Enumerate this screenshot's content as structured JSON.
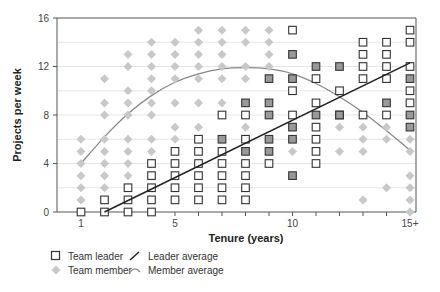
{
  "chart_data": {
    "type": "scatter",
    "title": "",
    "xlabel": "Tenure (years)",
    "ylabel": "Projects per week",
    "xlim": [
      0.5,
      15.25
    ],
    "ylim": [
      0,
      16
    ],
    "x_ticks": [
      1,
      2,
      3,
      4,
      5,
      6,
      7,
      8,
      9,
      10,
      11,
      12,
      13,
      14,
      15
    ],
    "x_tick_labels": {
      "1": "1",
      "5": "5",
      "10": "10",
      "15": "15+"
    },
    "y_ticks": [
      0,
      4,
      8,
      12,
      16
    ],
    "y_gridlines": [
      2,
      4,
      6,
      8,
      10,
      12,
      14
    ],
    "grid": true,
    "legend_position": "bottom-left",
    "series": [
      {
        "name": "Team member",
        "marker": "diamond",
        "color": "#c8c8c8",
        "points": [
          [
            1,
            1
          ],
          [
            1,
            2
          ],
          [
            1,
            3
          ],
          [
            1,
            4
          ],
          [
            1,
            5
          ],
          [
            1,
            6
          ],
          [
            2,
            2
          ],
          [
            2,
            3
          ],
          [
            2,
            4
          ],
          [
            2,
            5
          ],
          [
            2,
            6
          ],
          [
            2,
            8
          ],
          [
            2,
            9
          ],
          [
            2,
            11
          ],
          [
            3,
            3
          ],
          [
            3,
            4
          ],
          [
            3,
            5
          ],
          [
            3,
            6
          ],
          [
            3,
            8
          ],
          [
            3,
            9
          ],
          [
            3,
            10
          ],
          [
            3,
            12
          ],
          [
            3,
            13
          ],
          [
            4,
            5
          ],
          [
            4,
            6
          ],
          [
            4,
            8
          ],
          [
            4,
            9
          ],
          [
            4,
            10
          ],
          [
            4,
            11
          ],
          [
            4,
            12
          ],
          [
            4,
            13
          ],
          [
            4,
            14
          ],
          [
            5,
            6
          ],
          [
            5,
            7
          ],
          [
            5,
            9
          ],
          [
            5,
            11
          ],
          [
            5,
            12
          ],
          [
            5,
            13
          ],
          [
            5,
            14
          ],
          [
            6,
            7
          ],
          [
            6,
            9
          ],
          [
            6,
            11
          ],
          [
            6,
            12
          ],
          [
            6,
            13
          ],
          [
            6,
            14
          ],
          [
            6,
            15
          ],
          [
            7,
            9
          ],
          [
            7,
            11
          ],
          [
            7,
            12
          ],
          [
            7,
            13
          ],
          [
            7,
            14
          ],
          [
            7,
            15
          ],
          [
            8,
            7
          ],
          [
            8,
            11
          ],
          [
            8,
            12
          ],
          [
            8,
            14
          ],
          [
            8,
            15
          ],
          [
            9,
            12
          ],
          [
            9,
            13
          ],
          [
            9,
            14
          ],
          [
            9,
            15
          ],
          [
            10,
            5
          ],
          [
            11,
            7
          ],
          [
            12,
            5
          ],
          [
            12,
            7
          ],
          [
            13,
            1
          ],
          [
            13,
            5
          ],
          [
            13,
            6
          ],
          [
            13,
            7
          ],
          [
            13,
            8
          ],
          [
            14,
            2
          ],
          [
            14,
            6
          ],
          [
            14,
            7
          ],
          [
            14,
            8
          ],
          [
            15,
            0
          ],
          [
            15,
            1
          ],
          [
            15,
            2
          ],
          [
            15,
            3
          ],
          [
            15,
            5
          ],
          [
            15,
            6
          ]
        ]
      },
      {
        "name": "Team leader",
        "marker": "square",
        "color": "#ffffff",
        "stroke": "#333333",
        "points": [
          [
            1,
            0
          ],
          [
            2,
            0
          ],
          [
            2,
            1
          ],
          [
            3,
            0
          ],
          [
            3,
            1
          ],
          [
            3,
            2
          ],
          [
            4,
            0
          ],
          [
            4,
            1
          ],
          [
            4,
            2
          ],
          [
            4,
            3
          ],
          [
            4,
            4
          ],
          [
            5,
            1
          ],
          [
            5,
            2
          ],
          [
            5,
            3
          ],
          [
            5,
            4
          ],
          [
            5,
            5
          ],
          [
            6,
            1
          ],
          [
            6,
            2
          ],
          [
            6,
            3
          ],
          [
            6,
            4
          ],
          [
            6,
            5
          ],
          [
            6,
            6
          ],
          [
            7,
            1
          ],
          [
            7,
            2
          ],
          [
            7,
            3
          ],
          [
            7,
            4
          ],
          [
            7,
            5
          ],
          [
            7,
            8
          ],
          [
            8,
            1
          ],
          [
            8,
            2
          ],
          [
            8,
            3
          ],
          [
            8,
            4
          ],
          [
            8,
            6
          ],
          [
            8,
            8
          ],
          [
            9,
            4
          ],
          [
            10,
            8
          ],
          [
            10,
            10
          ],
          [
            10,
            15
          ],
          [
            11,
            4
          ],
          [
            11,
            5
          ],
          [
            11,
            6
          ],
          [
            11,
            7
          ],
          [
            11,
            9
          ],
          [
            11,
            11
          ],
          [
            12,
            8
          ],
          [
            12,
            10
          ],
          [
            13,
            8
          ],
          [
            13,
            11
          ],
          [
            13,
            12
          ],
          [
            13,
            13
          ],
          [
            13,
            14
          ],
          [
            14,
            8
          ],
          [
            14,
            11
          ],
          [
            14,
            12
          ],
          [
            14,
            13
          ],
          [
            14,
            14
          ],
          [
            15,
            9
          ],
          [
            15,
            10
          ],
          [
            15,
            12
          ],
          [
            15,
            14
          ],
          [
            15,
            15
          ]
        ]
      },
      {
        "name": "Team leader (highlighted)",
        "marker": "square-filled",
        "color": "#999999",
        "stroke": "#333333",
        "points": [
          [
            7,
            6
          ],
          [
            8,
            5
          ],
          [
            8,
            9
          ],
          [
            9,
            5
          ],
          [
            9,
            6
          ],
          [
            9,
            8
          ],
          [
            9,
            9
          ],
          [
            9,
            11
          ],
          [
            10,
            3
          ],
          [
            10,
            6
          ],
          [
            10,
            7
          ],
          [
            10,
            11
          ],
          [
            10,
            13
          ],
          [
            11,
            8
          ],
          [
            11,
            12
          ],
          [
            12,
            8
          ],
          [
            12,
            12
          ],
          [
            14,
            9
          ],
          [
            15,
            7
          ],
          [
            15,
            8
          ],
          [
            15,
            11
          ]
        ]
      }
    ],
    "trend_lines": [
      {
        "name": "Leader average",
        "type": "linear",
        "color": "#222222",
        "points": [
          [
            2,
            0
          ],
          [
            15,
            12.3
          ]
        ]
      },
      {
        "name": "Member average",
        "type": "curve",
        "color": "#888888",
        "points": [
          [
            1,
            4
          ],
          [
            2,
            6.2
          ],
          [
            3,
            8.1
          ],
          [
            4,
            9.6
          ],
          [
            5,
            10.7
          ],
          [
            6,
            11.4
          ],
          [
            7,
            11.8
          ],
          [
            8,
            11.9
          ],
          [
            9,
            11.8
          ],
          [
            10,
            11.4
          ],
          [
            11,
            10.6
          ],
          [
            12,
            9.5
          ],
          [
            13,
            8.2
          ],
          [
            14,
            6.7
          ],
          [
            15,
            5.1
          ]
        ]
      }
    ]
  },
  "axes": {
    "ylabel": "Projects per week",
    "xlabel": "Tenure (years)"
  },
  "legend": {
    "items": [
      {
        "label": "Team leader",
        "icon": "square-outline-icon"
      },
      {
        "label": "Leader average",
        "icon": "dark-line-icon"
      },
      {
        "label": "Team member",
        "icon": "grey-diamond-icon"
      },
      {
        "label": "Member average",
        "icon": "grey-curve-icon"
      }
    ]
  }
}
